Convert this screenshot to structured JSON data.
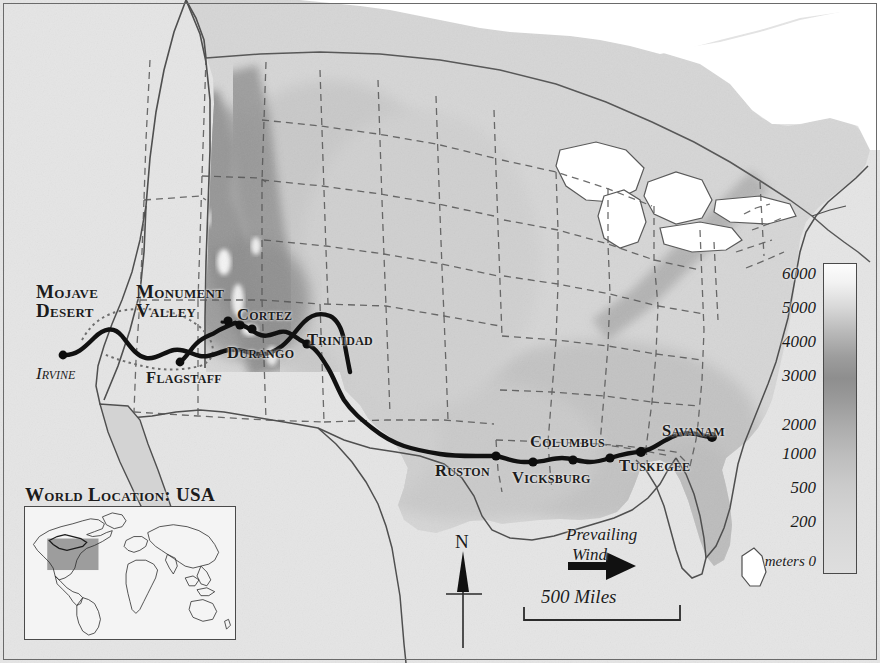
{
  "map": {
    "title": "USA elevation map with cross-country route",
    "background_color": "#e6e6e6",
    "land_color": "#d2d2d2",
    "water_color": "#ffffff",
    "route_color": "#111111",
    "border_color": "#6a6a6a"
  },
  "cities": [
    {
      "name": "Irvine",
      "x": 63,
      "y": 355,
      "label_x": 36,
      "label_y": 366,
      "label_style": "italic"
    },
    {
      "name": "Flagstaff",
      "x": 180,
      "y": 362,
      "label_x": 146,
      "label_y": 370
    },
    {
      "name": "Cortez",
      "x": 235,
      "y": 323,
      "label_x": 238,
      "label_y": 308
    },
    {
      "name": "Durango",
      "x": 252,
      "y": 329,
      "label_x": 228,
      "label_y": 345
    },
    {
      "name": "Trinidad",
      "x": 307,
      "y": 344,
      "label_x": 308,
      "label_y": 332
    },
    {
      "name": "Ruston",
      "x": 496,
      "y": 456,
      "label_x": 436,
      "label_y": 464
    },
    {
      "name": "Vicksburg",
      "x": 533,
      "y": 462,
      "label_x": 513,
      "label_y": 470
    },
    {
      "name": "Columbus",
      "x": 610,
      "y": 458,
      "label_x": 531,
      "label_y": 434
    },
    {
      "name": "Tuskegee",
      "x": 641,
      "y": 452,
      "label_x": 620,
      "label_y": 458
    },
    {
      "name": "Savanam",
      "x": 712,
      "y": 437,
      "label_x": 663,
      "label_y": 423
    }
  ],
  "regions": [
    {
      "line1": "Mojave",
      "line2": "Desert",
      "x": 36,
      "y": 286
    },
    {
      "line1": "Monument",
      "line2": "Valley",
      "x": 136,
      "y": 286
    }
  ],
  "legend": {
    "unit_label": "meters",
    "ticks": [
      {
        "label": "6000",
        "y": 264
      },
      {
        "label": "5000",
        "y": 298
      },
      {
        "label": "4000",
        "y": 332
      },
      {
        "label": "3000",
        "y": 366
      },
      {
        "label": "2000",
        "y": 415
      },
      {
        "label": "1000",
        "y": 444
      },
      {
        "label": "500",
        "y": 478
      },
      {
        "label": "200",
        "y": 512
      },
      {
        "label": "0",
        "y": 553,
        "unit": "meters"
      }
    ]
  },
  "inset": {
    "title": "World Location:  USA",
    "highlight_color": "#9a9a9a"
  },
  "annotations": {
    "north": "N",
    "wind_line1": "Prevailing",
    "wind_line2": "Wind",
    "scale": "500 Miles"
  }
}
